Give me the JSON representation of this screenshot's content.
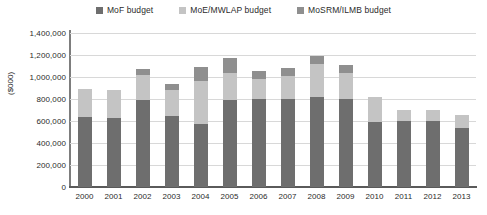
{
  "chart_data": {
    "type": "bar",
    "stacked": true,
    "title": "",
    "subtitle": "",
    "xlabel": "",
    "ylabel": "($000)",
    "ylim": [
      0,
      1400000
    ],
    "ytick_step": 200000,
    "grid": true,
    "legend_position": "top-center",
    "categories": [
      "2000",
      "2001",
      "2002",
      "2003",
      "2004",
      "2005",
      "2006",
      "2007",
      "2008",
      "2009",
      "2010",
      "2011",
      "2012",
      "2013"
    ],
    "ytick_labels": [
      "1,400,000",
      "1,200,000",
      "1,000,000",
      "800,000",
      "600,000",
      "400,000",
      "200,000",
      "0"
    ],
    "ytick_values": [
      1400000,
      1200000,
      1000000,
      800000,
      600000,
      400000,
      200000,
      0
    ],
    "series": [
      {
        "name": "MoF budget",
        "color": "#6e6e6e",
        "values": [
          640000,
          630000,
          790000,
          650000,
          575000,
          790000,
          800000,
          800000,
          820000,
          800000,
          590000,
          600000,
          600000,
          540000
        ]
      },
      {
        "name": "MoE/MWLAP budget",
        "color": "#c4c4c4",
        "values": [
          250000,
          255000,
          230000,
          230000,
          385000,
          250000,
          185000,
          210000,
          300000,
          240000,
          230000,
          100000,
          100000,
          115000
        ]
      },
      {
        "name": "MoSRM/ILMB budget",
        "color": "#8f8f8f",
        "values": [
          0,
          0,
          55000,
          60000,
          135000,
          130000,
          70000,
          75000,
          75000,
          70000,
          0,
          0,
          0,
          0
        ]
      }
    ],
    "totals": [
      890000,
      885000,
      1075000,
      940000,
      1095000,
      1170000,
      1055000,
      1085000,
      1195000,
      1110000,
      820000,
      700000,
      700000,
      655000
    ]
  },
  "legend": {
    "items": [
      {
        "label": "MoF budget",
        "color": "#6e6e6e"
      },
      {
        "label": "MoE/MWLAP budget",
        "color": "#c4c4c4"
      },
      {
        "label": "MoSRM/ILMB budget",
        "color": "#8f8f8f"
      }
    ]
  },
  "axis": {
    "y_title": "($000)"
  },
  "colors": {
    "gridline": "#d8d8d8",
    "axis": "#5a5a5a",
    "text": "#2b2b2b",
    "background": "#ffffff"
  }
}
